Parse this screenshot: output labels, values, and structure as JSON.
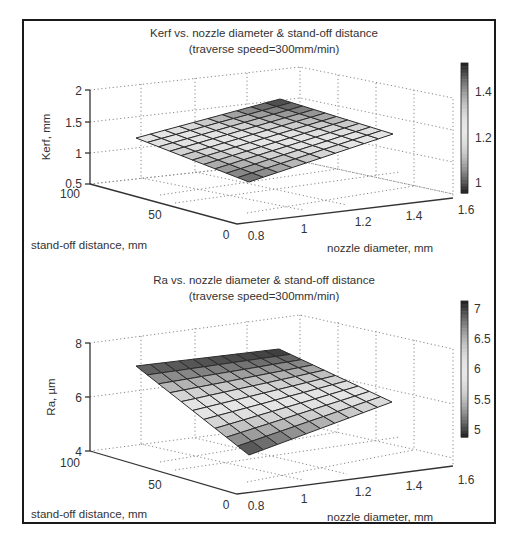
{
  "chart_data": [
    {
      "type": "surface",
      "title": "Kerf vs. nozzle diameter & stand-off distance",
      "subtitle": "(traverse speed=300mm/min)",
      "xlabel": "nozzle diameter, mm",
      "ylabel": "stand-off distance, mm",
      "zlabel": "Kerf, mm",
      "x_ticks": [
        "0.8",
        "1",
        "1.2",
        "1.4",
        "1.6"
      ],
      "y_ticks": [
        "0",
        "50",
        "100"
      ],
      "z_ticks": [
        "0.5",
        "1",
        "1.5",
        "2"
      ],
      "xlim": [
        0.8,
        1.6
      ],
      "ylim": [
        0,
        100
      ],
      "zlim": [
        0.5,
        2
      ],
      "colorbar": {
        "ticks": [
          "1",
          "1.2",
          "1.4"
        ],
        "range": [
          0.95,
          1.52
        ]
      },
      "grid": true,
      "grid_size": [
        11,
        11
      ],
      "corner_values": {
        "d0.8_s0": 1.0,
        "d0.8_s100": 1.2,
        "d1.6_s0": 1.25,
        "d1.6_s100": 1.5
      }
    },
    {
      "type": "surface",
      "title": "Ra vs. nozzle diameter & stand-off distance",
      "subtitle": "(traverse speed=300mm/min)",
      "xlabel": "nozzle diameter, mm",
      "ylabel": "stand-off distance, mm",
      "zlabel": "Ra, µm",
      "x_ticks": [
        "0.8",
        "1",
        "1.2",
        "1.4",
        "1.6"
      ],
      "y_ticks": [
        "0",
        "50",
        "100"
      ],
      "z_ticks": [
        "4",
        "6",
        "8"
      ],
      "xlim": [
        0.8,
        1.6
      ],
      "ylim": [
        0,
        100
      ],
      "zlim": [
        4,
        8
      ],
      "colorbar": {
        "ticks": [
          "5",
          "5.5",
          "6",
          "6.5",
          "7"
        ],
        "range": [
          4.95,
          7.05
        ]
      },
      "grid": true,
      "grid_size": [
        11,
        11
      ],
      "corner_values": {
        "d0.8_s0": 5.0,
        "d0.8_s100": 6.9,
        "d1.6_s0": 5.7,
        "d1.6_s100": 7.0
      }
    }
  ]
}
